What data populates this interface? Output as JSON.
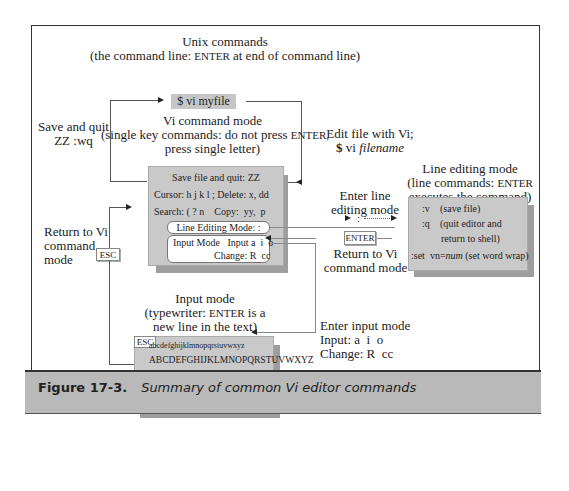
{
  "diagram": {
    "unix": {
      "title": "Unix commands",
      "subtitle_pre": "(the command line: ",
      "subtitle_key": "ENTER",
      "subtitle_post": " at end of command line)"
    },
    "start_command": "$ vi myfile",
    "vi_command_mode": {
      "title": "Vi command mode",
      "line2_pre": "(single key commands: do not press ",
      "line2_key": "ENTER,",
      "line3": "press single letter)",
      "rows": [
        "Save file and quit: ZZ",
        "Cursor: h j k l ;  Delete: x, dd",
        "Search: ( ? n    Copy:  yy,  p"
      ],
      "line_editing_label": "Line Editing Mode:  :",
      "input_mode_label": "Input Mode   Input a  i  o",
      "change_label": "Change: R  cc"
    },
    "left_labels": {
      "save_quit_1": "Save and quit",
      "save_quit_2": "ZZ   :wq",
      "return_1": "Return to Vi",
      "return_2": "command",
      "return_3": "mode",
      "esc_key": "ESC"
    },
    "right_labels": {
      "edit_1": "Edit file with Vi;",
      "edit_2_prefix": "$",
      "edit_2_cmd": " vi ",
      "edit_2_arg": "filename",
      "enter_line_1": "Enter line",
      "enter_line_2": "editing mode",
      "colon": ":",
      "enter_key": "ENTER",
      "return_vi_1": "Return to Vi",
      "return_vi_2": "command mode"
    },
    "line_editing_mode": {
      "title": "Line editing mode",
      "sub1_pre": "(line commands: ",
      "sub1_key": "ENTER",
      "sub2": "executes the command)",
      "rows": [
        {
          "cmd": ":v",
          "desc": "(save file)"
        },
        {
          "cmd": ":q",
          "desc": "(quit editor and"
        },
        {
          "cmd": "",
          "desc": "return to shell)"
        },
        {
          "cmd": ":set  vn=",
          "cmd_italic": "num",
          "desc": "(set word wrap)"
        }
      ]
    },
    "input_mode": {
      "title": "Input mode",
      "sub1_pre": "(typewriter: ",
      "sub1_key": "ENTER",
      "sub1_post": " is a",
      "sub2": "new line in the text)",
      "esc_key": "ESC",
      "rows": [
        "abcdefghijklmnopqrstuvwxyz",
        "ABCDEFGHIJKLMNOPQRSTUVWXYZ",
        "1234567890-=[]\\;',./`",
        "!@#$%^&*()_+{}|:\"<>?~",
        "(tab) (enter)"
      ]
    },
    "enter_input": {
      "line1": "Enter input mode",
      "line2": "Input: a  i  o",
      "line3": "Change: R  cc"
    }
  },
  "caption": {
    "label": "Figure 17-3.",
    "text": "Summary of common Vi editor commands"
  },
  "colors": {
    "box_fill": "#c9c9c9",
    "shadow": "#9e9e9e",
    "caption_bar": "#b9b9b9",
    "border": "#333333"
  }
}
